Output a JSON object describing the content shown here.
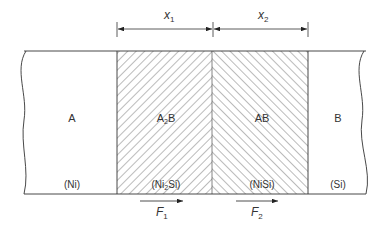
{
  "diagram": {
    "dimensions": {
      "x1": {
        "base": "x",
        "sub": "1"
      },
      "x2": {
        "base": "x",
        "sub": "2"
      }
    },
    "regions": [
      {
        "id": "A",
        "label": "A",
        "material": "(Ni)"
      },
      {
        "id": "A2B",
        "label_base": "A",
        "label_sub": "2",
        "label_end": "B",
        "material_pre": "(Ni",
        "material_sub": "2",
        "material_post": "Si)"
      },
      {
        "id": "AB",
        "label": "AB",
        "material": "(NiSi)"
      },
      {
        "id": "B",
        "label": "B",
        "material": "(Si)"
      }
    ],
    "fluxes": [
      {
        "base": "F",
        "sub": "1"
      },
      {
        "base": "F",
        "sub": "2"
      }
    ],
    "colors": {
      "line": "#333333",
      "hatch": "#555555",
      "background": "#ffffff"
    }
  }
}
